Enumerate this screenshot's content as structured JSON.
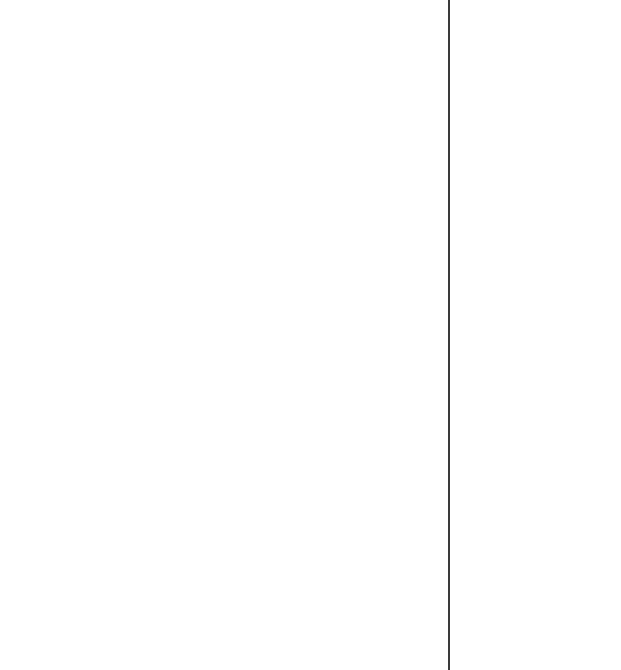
{
  "layout": {
    "divider_color": "#3a3a3a",
    "background_color": "#ffffff"
  }
}
